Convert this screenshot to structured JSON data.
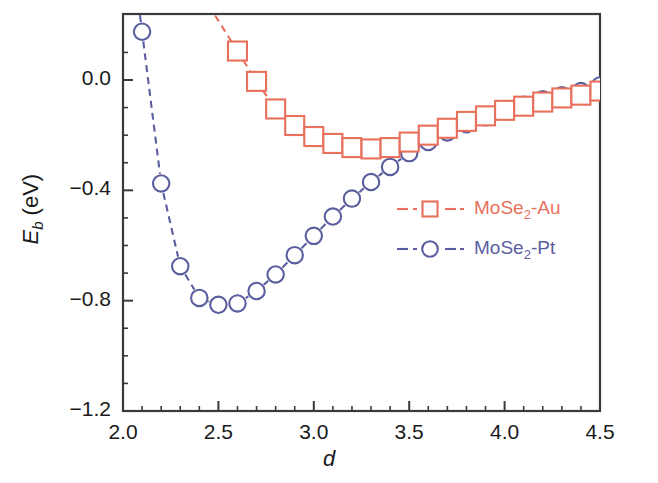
{
  "chart_data": {
    "type": "scatter",
    "title": "",
    "xlabel": "d",
    "ylabel": "E_b (eV)",
    "ylabel_main": "E",
    "ylabel_sub": "b",
    "ylabel_unit": " (eV)",
    "xlim": [
      2.0,
      4.5
    ],
    "ylim": [
      -1.2,
      0.2
    ],
    "xticks": [
      "2.0",
      "2.5",
      "3.0",
      "3.5",
      "4.0",
      "4.5"
    ],
    "xtick_values": [
      2.0,
      2.5,
      3.0,
      3.5,
      4.0,
      4.5
    ],
    "xminor_values": [
      2.1,
      2.2,
      2.3,
      2.4,
      2.6,
      2.7,
      2.8,
      2.9,
      3.1,
      3.2,
      3.3,
      3.4,
      3.6,
      3.7,
      3.8,
      3.9,
      4.1,
      4.2,
      4.3,
      4.4
    ],
    "yticks": [
      "0.0",
      "-0.4",
      "-0.8",
      "-1.2"
    ],
    "ytick_values": [
      0.0,
      -0.4,
      -0.8,
      -1.2
    ],
    "yminor_values": [
      0.1,
      -0.1,
      -0.2,
      -0.3,
      -0.5,
      -0.6,
      -0.7,
      -0.9,
      -1.0,
      -1.1
    ],
    "grid": false,
    "legend_position": "center-right",
    "series": [
      {
        "name": "MoSe2-Au",
        "name_main": "MoSe",
        "name_sub": "2",
        "name_tail": "-Au",
        "color": "#e8705c",
        "marker": "square",
        "linestyle": "dashed",
        "x": [
          2.6,
          2.7,
          2.8,
          2.9,
          3.0,
          3.1,
          3.2,
          3.3,
          3.4,
          3.5,
          3.6,
          3.7,
          3.8,
          3.9,
          4.0,
          4.1,
          4.2,
          4.3,
          4.4,
          4.5
        ],
        "y": [
          0.105,
          -0.005,
          -0.105,
          -0.165,
          -0.205,
          -0.23,
          -0.245,
          -0.25,
          -0.245,
          -0.225,
          -0.2,
          -0.175,
          -0.15,
          -0.13,
          -0.11,
          -0.095,
          -0.08,
          -0.065,
          -0.055,
          -0.04
        ]
      },
      {
        "name": "MoSe2-Pt",
        "name_main": "MoSe",
        "name_sub": "2",
        "name_tail": "-Pt",
        "color": "#5b5e9e",
        "marker": "circle",
        "linestyle": "dashed",
        "x": [
          2.1,
          2.2,
          2.3,
          2.4,
          2.5,
          2.6,
          2.7,
          2.8,
          2.9,
          3.0,
          3.1,
          3.2,
          3.3,
          3.4,
          3.5,
          3.6,
          3.7,
          3.8,
          3.9,
          4.0,
          4.1,
          4.2,
          4.3,
          4.4,
          4.5
        ],
        "y": [
          0.175,
          -0.375,
          -0.675,
          -0.79,
          -0.815,
          -0.81,
          -0.765,
          -0.705,
          -0.635,
          -0.565,
          -0.495,
          -0.43,
          -0.37,
          -0.315,
          -0.265,
          -0.225,
          -0.19,
          -0.16,
          -0.135,
          -0.11,
          -0.09,
          -0.07,
          -0.055,
          -0.04,
          -0.02
        ]
      }
    ]
  },
  "legend": {
    "items": [
      {
        "label_main": "MoSe",
        "label_sub": "2",
        "label_tail": "-Au",
        "color": "#e8705c",
        "marker": "square-icon"
      },
      {
        "label_main": "MoSe",
        "label_sub": "2",
        "label_tail": "-Pt",
        "color": "#5b5e9e",
        "marker": "circle-icon"
      }
    ]
  }
}
